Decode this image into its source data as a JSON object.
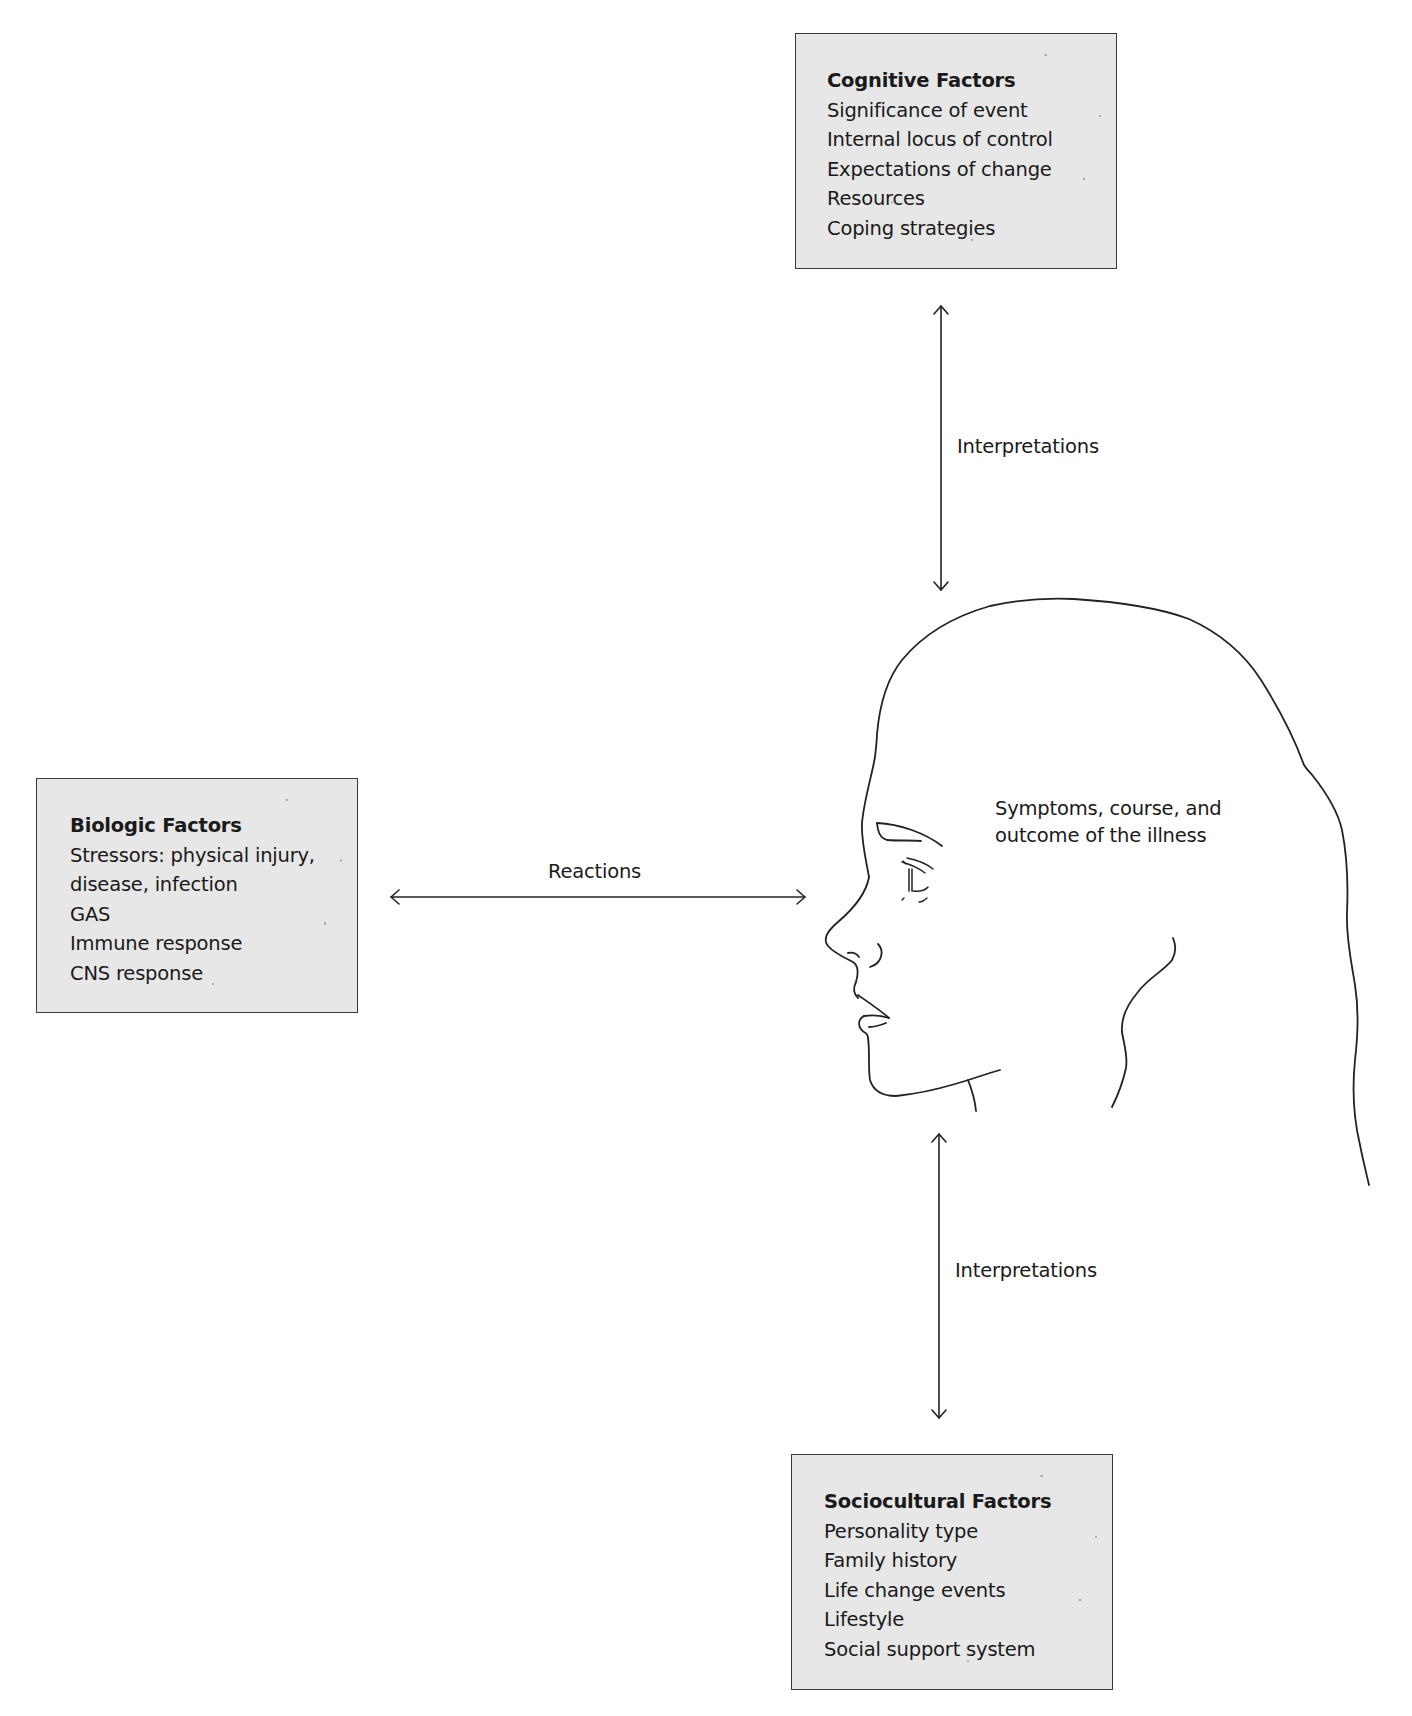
{
  "diagram": {
    "type": "biopsychosocial stress-illness model",
    "center": {
      "figure": "head-profile",
      "label_lines": [
        "Symptoms, course, and",
        "outcome of the illness"
      ]
    },
    "boxes": {
      "cognitive": {
        "title": "Cognitive Factors",
        "items": [
          "Significance of event",
          "Internal locus of control",
          "Expectations of change",
          "Resources",
          "Coping strategies"
        ]
      },
      "biologic": {
        "title": "Biologic Factors",
        "items": [
          "Stressors: physical injury,",
          "disease, infection",
          "GAS",
          "Immune response",
          "CNS response"
        ]
      },
      "sociocultural": {
        "title": "Sociocultural Factors",
        "items": [
          "Personality type",
          "Family history",
          "Life change events",
          "Lifestyle",
          "Social support system"
        ]
      }
    },
    "connections": {
      "top": {
        "label": "Interpretations",
        "from": "cognitive",
        "to": "head",
        "direction": "bidirectional"
      },
      "left": {
        "label": "Reactions",
        "from": "biologic",
        "to": "head",
        "direction": "bidirectional"
      },
      "bottom": {
        "label": "Interpretations",
        "from": "sociocultural",
        "to": "head",
        "direction": "bidirectional"
      }
    },
    "colors": {
      "box_fill": "#e7e7e7",
      "box_border": "#3a3a3a",
      "line": "#222222",
      "text": "#1a1a1a"
    }
  }
}
